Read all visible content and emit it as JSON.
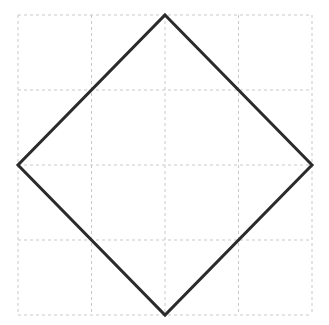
{
  "figure": {
    "canvas": {
      "width": 329,
      "height": 325,
      "background": "#ffffff"
    },
    "grid": {
      "x_lines": [
        18,
        91.5,
        165,
        238.5,
        312
      ],
      "y_lines": [
        15,
        90,
        165,
        240,
        315
      ],
      "x_extent": [
        18,
        312
      ],
      "y_extent": [
        15,
        315
      ],
      "rows": 4,
      "cols": 4,
      "color": "#c9c9c9",
      "dash_pattern": "3 3",
      "stroke_width": 1
    },
    "diamond": {
      "vertices": [
        [
          165,
          15
        ],
        [
          312,
          165
        ],
        [
          165,
          315
        ],
        [
          18,
          165
        ]
      ],
      "color": "#2b2b2b",
      "stroke_width": 3,
      "fill": "none"
    }
  }
}
